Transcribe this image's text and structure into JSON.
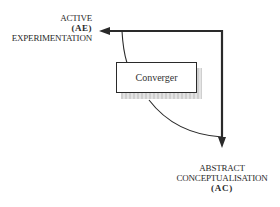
{
  "diagram": {
    "axes": {
      "horizontal": {
        "line1": "ACTIVE",
        "code": "(AE)",
        "line2": "EXPERIMENTATION"
      },
      "vertical": {
        "line1": "ABSTRACT",
        "line2": "CONCEPTUALISATION",
        "code": "(AC)"
      }
    },
    "quadrant": {
      "label": "Converger"
    },
    "colors": {
      "line": "#2a2a2a",
      "shadow": "#d6d6d6",
      "background": "#ffffff"
    }
  }
}
